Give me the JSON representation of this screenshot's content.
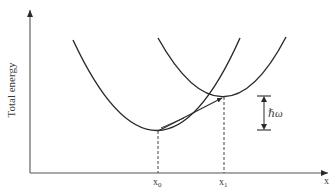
{
  "diagram": {
    "type": "configuration-coordinate energy diagram",
    "y_axis_label": "Total energy",
    "x_axis_label": "x",
    "tick_labels": {
      "x0": "x",
      "x0_sub": "0",
      "x1": "x",
      "x1_sub": "1"
    },
    "energy_gap_label": "ℏω",
    "colors": {
      "line": "#2a2a2a",
      "axis": "#555555",
      "text": "#3a3a3a"
    },
    "curves": [
      {
        "name": "ground-state-parabola",
        "start": [
          73,
          40
        ],
        "minimum": [
          158,
          131
        ],
        "end": [
          240,
          38
        ]
      },
      {
        "name": "displaced-parabola",
        "start": [
          158,
          38
        ],
        "minimum": [
          224,
          97
        ],
        "end": [
          286,
          37
        ]
      }
    ]
  }
}
